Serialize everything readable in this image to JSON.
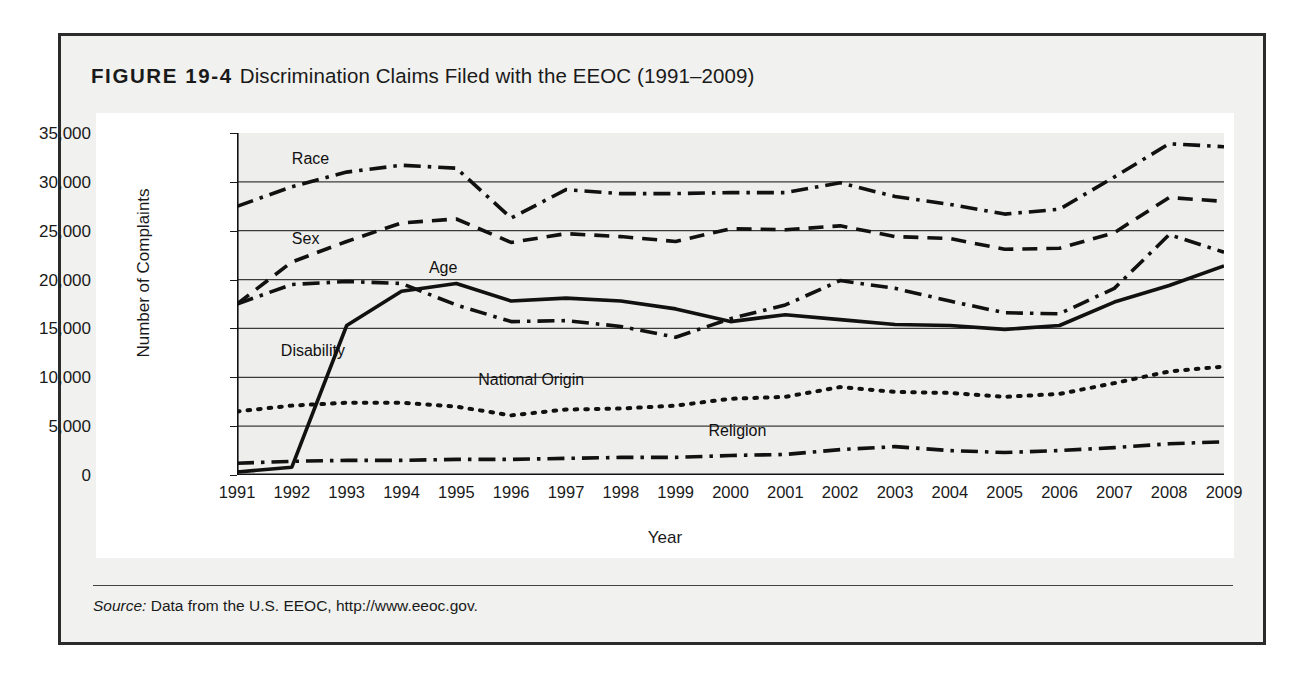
{
  "figure": {
    "number": "FIGURE 19-4",
    "caption": "Discrimination Claims Filed with the EEOC (1991–2009)",
    "source_prefix": "Source:",
    "source_text": "Data from the U.S. EEOC, http://www.eeoc.gov."
  },
  "chart_data": {
    "type": "line",
    "title": "Discrimination Claims Filed with the EEOC (1991–2009)",
    "xlabel": "Year",
    "ylabel": "Number of Complaints",
    "ylim": [
      0,
      35000
    ],
    "ytick_labels": [
      "0",
      "5,000",
      "10,000",
      "15,000",
      "20,000",
      "25,000",
      "30,000",
      "35,000"
    ],
    "ytick_values": [
      0,
      5000,
      10000,
      15000,
      20000,
      25000,
      30000,
      35000
    ],
    "grid": true,
    "legend_position": "inline-labels",
    "x": [
      1991,
      1992,
      1993,
      1994,
      1995,
      1996,
      1997,
      1998,
      1999,
      2000,
      2001,
      2002,
      2003,
      2004,
      2005,
      2006,
      2007,
      2008,
      2009
    ],
    "categories": [
      "1991",
      "1992",
      "1993",
      "1994",
      "1995",
      "1996",
      "1997",
      "1998",
      "1999",
      "2000",
      "2001",
      "2002",
      "2003",
      "2004",
      "2005",
      "2006",
      "2007",
      "2008",
      "2009"
    ],
    "series": [
      {
        "name": "Race",
        "dash": "dash-dot",
        "values": [
          27500,
          29500,
          31000,
          31700,
          31400,
          26300,
          29200,
          28800,
          28800,
          28900,
          28900,
          29900,
          28500,
          27700,
          26700,
          27200,
          30500,
          33900,
          33600
        ]
      },
      {
        "name": "Sex",
        "dash": "dashed",
        "values": [
          17500,
          21800,
          23900,
          25800,
          26200,
          23800,
          24700,
          24400,
          23900,
          25200,
          25100,
          25500,
          24400,
          24200,
          23100,
          23200,
          24800,
          28400,
          28000
        ]
      },
      {
        "name": "Age",
        "dash": "dash-dot",
        "values": [
          17500,
          19500,
          19800,
          19600,
          17400,
          15700,
          15800,
          15200,
          14100,
          16000,
          17400,
          19900,
          19100,
          17800,
          16600,
          16500,
          19100,
          24600,
          22800
        ]
      },
      {
        "name": "Disability",
        "dash": "solid",
        "values": [
          300,
          800,
          15300,
          18800,
          19600,
          17800,
          18100,
          17800,
          17000,
          15700,
          16400,
          15900,
          15400,
          15300,
          14900,
          15300,
          17700,
          19400,
          21400
        ]
      },
      {
        "name": "National Origin",
        "dash": "dotted",
        "values": [
          6500,
          7100,
          7400,
          7400,
          7000,
          6100,
          6700,
          6800,
          7100,
          7800,
          8000,
          9000,
          8500,
          8400,
          8000,
          8300,
          9400,
          10600,
          11100
        ]
      },
      {
        "name": "Religion",
        "dash": "dash-dot",
        "values": [
          1200,
          1400,
          1500,
          1500,
          1600,
          1600,
          1700,
          1800,
          1800,
          2000,
          2100,
          2600,
          2900,
          2500,
          2300,
          2500,
          2800,
          3200,
          3400
        ]
      }
    ],
    "inline_labels": [
      {
        "text": "Race",
        "x": 1992.0,
        "y": 32200
      },
      {
        "text": "Sex",
        "x": 1992.0,
        "y": 24000
      },
      {
        "text": "Age",
        "x": 1994.5,
        "y": 21100
      },
      {
        "text": "Disability",
        "x": 1991.8,
        "y": 12600
      },
      {
        "text": "National Origin",
        "x": 1995.4,
        "y": 9600
      },
      {
        "text": "Religion",
        "x": 1999.6,
        "y": 4400
      }
    ]
  }
}
